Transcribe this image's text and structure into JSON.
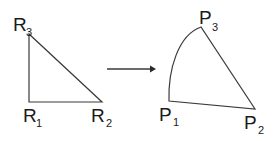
{
  "diagram": {
    "colors": {
      "stroke": "#3a3a3a",
      "text": "#1a1a1a",
      "background": "#ffffff"
    },
    "source_triangle": {
      "vertices": [
        {
          "name": "R",
          "sub": "1"
        },
        {
          "name": "R",
          "sub": "2"
        },
        {
          "name": "R",
          "sub": "3"
        }
      ]
    },
    "arrow": {
      "direction": "right",
      "meaning": "maps-to"
    },
    "target_shape": {
      "vertices": [
        {
          "name": "P",
          "sub": "1"
        },
        {
          "name": "P",
          "sub": "2"
        },
        {
          "name": "P",
          "sub": "3"
        }
      ],
      "curved_edge": "P1-P3"
    }
  }
}
